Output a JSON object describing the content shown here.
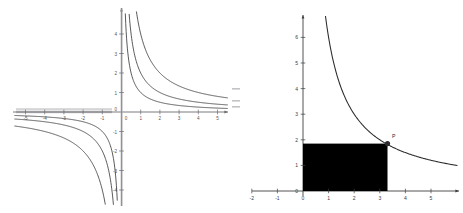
{
  "figure": {
    "title": "",
    "background_color": "#ffffff",
    "panel_count": 2
  },
  "chart_data": [
    {
      "panel": "left",
      "type": "line",
      "title": "",
      "xlabel": "",
      "ylabel": "",
      "grid": false,
      "legend": "none",
      "xlim": [
        -5.6,
        5.8
      ],
      "ylim": [
        -4.8,
        4.8
      ],
      "xticks": [
        -5,
        -4,
        -3,
        -2,
        -1,
        0,
        1,
        2,
        3,
        4,
        5
      ],
      "xtick_labels": [
        "-5",
        "-4",
        "-3",
        "-2",
        "-1",
        "0",
        "1",
        "2",
        "3",
        "4",
        "5"
      ],
      "yticks": [
        -4,
        -3,
        -2,
        -1,
        0,
        1,
        2,
        3,
        4
      ],
      "ytick_labels": [
        "-4",
        "-3",
        "-2",
        "-1",
        "0",
        "1",
        "2",
        "3",
        "4"
      ],
      "origin_label": "0",
      "series": [
        {
          "name": "y = 1/x",
          "k": 1,
          "x": [
            0.22,
            0.3,
            0.4,
            0.5,
            0.7,
            1,
            1.5,
            2,
            3,
            4,
            5,
            5.7
          ],
          "values": [
            4.55,
            3.33,
            2.5,
            2,
            1.43,
            1,
            0.67,
            0.5,
            0.33,
            0.25,
            0.2,
            0.18
          ]
        },
        {
          "name": "y = 2/x",
          "k": 2,
          "x": [
            0.44,
            0.6,
            0.8,
            1,
            1.4,
            2,
            3,
            4,
            5,
            5.7
          ],
          "values": [
            4.55,
            3.33,
            2.5,
            2,
            1.43,
            1,
            0.67,
            0.5,
            0.4,
            0.35
          ]
        },
        {
          "name": "y = 4/x",
          "k": 4,
          "x": [
            0.88,
            1.2,
            1.6,
            2,
            2.8,
            4,
            5,
            5.7
          ],
          "values": [
            4.55,
            3.33,
            2.5,
            2,
            1.43,
            1,
            0.8,
            0.7
          ]
        },
        {
          "name": "y = 1/x (third quadrant)",
          "k": 1,
          "x": [
            -5.6,
            -5,
            -4,
            -3,
            -2,
            -1.5,
            -1,
            -0.7,
            -0.5,
            -0.4,
            -0.3,
            -0.22
          ],
          "values": [
            -0.18,
            -0.2,
            -0.25,
            -0.33,
            -0.5,
            -0.67,
            -1,
            -1.43,
            -2,
            -2.5,
            -3.33,
            -4.55
          ]
        },
        {
          "name": "y = 2/x (third quadrant)",
          "k": 2,
          "x": [
            -5.6,
            -5,
            -4,
            -3,
            -2,
            -1.4,
            -1,
            -0.8,
            -0.6,
            -0.44
          ],
          "values": [
            -0.36,
            -0.4,
            -0.5,
            -0.67,
            -1,
            -1.43,
            -2,
            -2.5,
            -3.33,
            -4.55
          ]
        },
        {
          "name": "y = 4/x (third quadrant)",
          "k": 4,
          "x": [
            -5.6,
            -5,
            -4,
            -2.8,
            -2,
            -1.6,
            -1.2,
            -0.88
          ],
          "values": [
            -0.71,
            -0.8,
            -1,
            -1.43,
            -2,
            -2.5,
            -3.33,
            -4.55
          ]
        }
      ]
    },
    {
      "panel": "right",
      "type": "line",
      "title": "",
      "xlabel": "",
      "ylabel": "",
      "grid": false,
      "legend": "none",
      "xlim": [
        -2.4,
        5.8
      ],
      "ylim": [
        -0.45,
        7.1
      ],
      "xticks": [
        -2,
        -1,
        0,
        1,
        2,
        3,
        4,
        5
      ],
      "xtick_labels": [
        "-2",
        "-1",
        "0",
        "1",
        "2",
        "3",
        "4",
        "5"
      ],
      "yticks": [
        0,
        1,
        2,
        3,
        4,
        5,
        6
      ],
      "ytick_labels": [
        "0",
        "1",
        "2",
        "3",
        "4",
        "5",
        "6"
      ],
      "origin_label": "0",
      "series": [
        {
          "name": "y = 6/x",
          "k": 6,
          "x": [
            0.86,
            1,
            1.2,
            1.5,
            2,
            2.5,
            3,
            3.3,
            4,
            4.5,
            5,
            5.5
          ],
          "values": [
            7.0,
            6.0,
            5.0,
            4.0,
            3.0,
            2.4,
            2.0,
            1.85,
            1.5,
            1.33,
            1.2,
            1.1
          ]
        }
      ],
      "annotations": [
        {
          "type": "point",
          "label": "P",
          "x": 3.3,
          "y": 1.85,
          "marker": "filled-circle"
        },
        {
          "type": "rectangle",
          "label": "shaded region",
          "x0": 0,
          "y0": 0,
          "x1": 3.3,
          "y1": 1.85,
          "fill": "#000000"
        }
      ]
    }
  ],
  "colors": {
    "curve": "#3c3c40",
    "curve_right": "#2a2a2e",
    "axis": "#6b6b70",
    "axis_right": "#3e3e42",
    "rectangle_fill": "#000000",
    "tick_text": "#55555a",
    "background": "#ffffff"
  }
}
